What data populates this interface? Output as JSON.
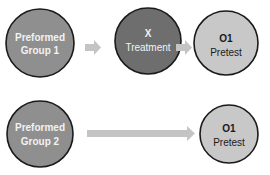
{
  "colors": {
    "group_fill": "#8f8f8f",
    "treatment_fill": "#6e6e6e",
    "observation_fill": "#c8c8c8",
    "outline": "#1a1a1a",
    "arrow": "#c4c4c4"
  },
  "row1": {
    "group": {
      "line1": "Preformed",
      "line2": "Group 1"
    },
    "treatment": {
      "line1": "X",
      "line2": "Treatment"
    },
    "observation": {
      "line1": "O1",
      "line2": "Pretest"
    }
  },
  "row2": {
    "group": {
      "line1": "Preformed",
      "line2": "Group 2"
    },
    "observation": {
      "line1": "O1",
      "line2": "Pretest"
    }
  }
}
